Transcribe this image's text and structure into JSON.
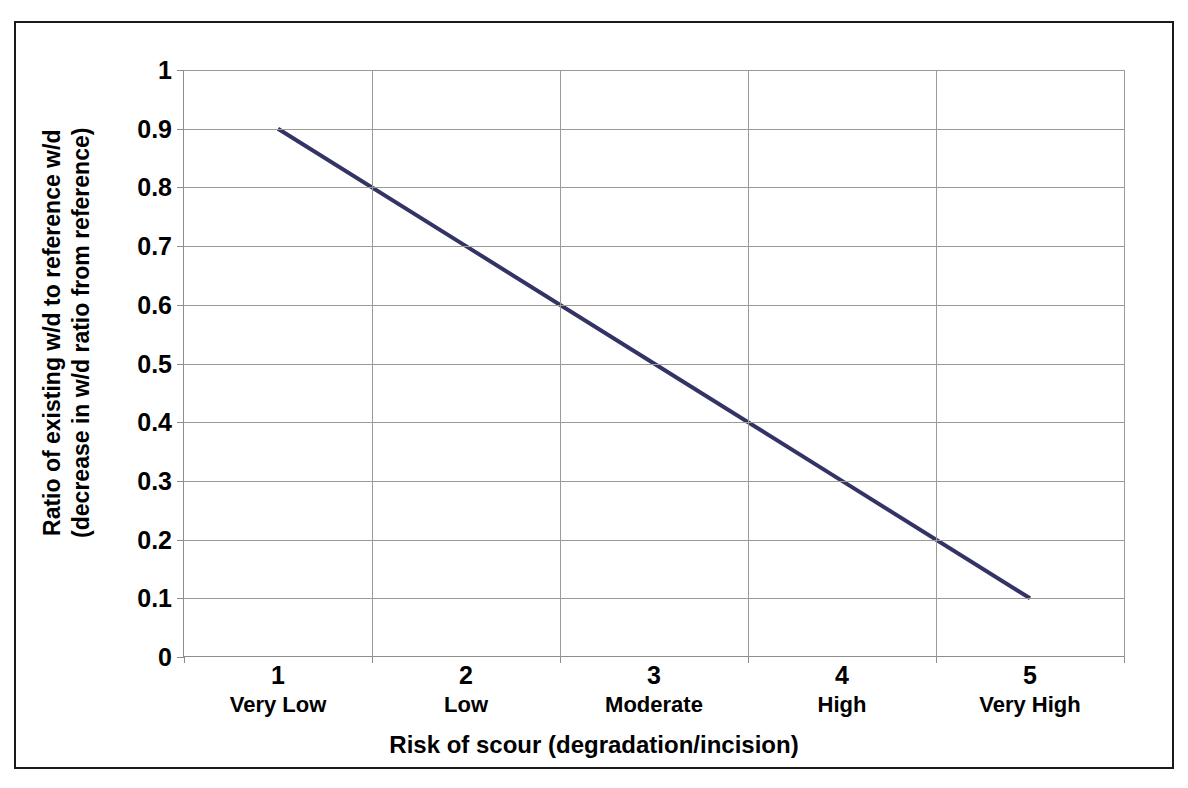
{
  "chart_data": {
    "type": "line",
    "title": "",
    "xlabel": "Risk of scour (degradation/incision)",
    "ylabel_line1": "Ratio of existing w/d to reference w/d",
    "ylabel_line2": "(decrease in w/d ratio from reference)",
    "categories": [
      "1",
      "2",
      "3",
      "4",
      "5"
    ],
    "category_names": [
      "Very Low",
      "Low",
      "Moderate",
      "High",
      "Very High"
    ],
    "values": [
      0.9,
      0.7,
      0.5,
      0.3,
      0.1
    ],
    "series": [
      {
        "name": "Ratio of existing w/d to reference w/d",
        "values": [
          0.9,
          0.7,
          0.5,
          0.3,
          0.1
        ],
        "color": "#333366"
      }
    ],
    "ylim": [
      0,
      1
    ],
    "ytick_labels": [
      "1",
      "0.9",
      "0.8",
      "0.7",
      "0.6",
      "0.5",
      "0.4",
      "0.3",
      "0.2",
      "0.1",
      "0"
    ],
    "ytick_values": [
      1,
      0.9,
      0.8,
      0.7,
      0.6,
      0.5,
      0.4,
      0.3,
      0.2,
      0.1,
      0
    ],
    "grid": "horizontal-and-vertical",
    "legend": "none",
    "gridline_color": "#9b9b93",
    "axis_color": "#8e8e86",
    "border_color": "#1a1a1a",
    "background_color": "#ffffff"
  }
}
